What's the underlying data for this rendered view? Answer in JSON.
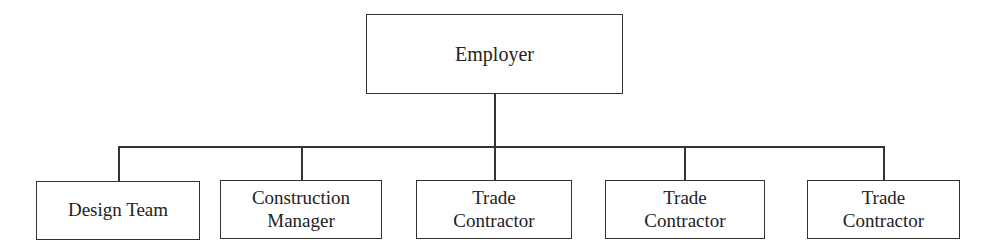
{
  "diagram": {
    "type": "org-chart",
    "root": {
      "label": "Employer"
    },
    "children": [
      {
        "lines": [
          "Design Team"
        ]
      },
      {
        "lines": [
          "Construction",
          "Manager"
        ]
      },
      {
        "lines": [
          "Trade",
          "Contractor"
        ]
      },
      {
        "lines": [
          "Trade",
          "Contractor"
        ]
      },
      {
        "lines": [
          "Trade",
          "Contractor"
        ]
      }
    ]
  },
  "colors": {
    "stroke": "#333333",
    "background": "#ffffff",
    "text": "#222222"
  }
}
